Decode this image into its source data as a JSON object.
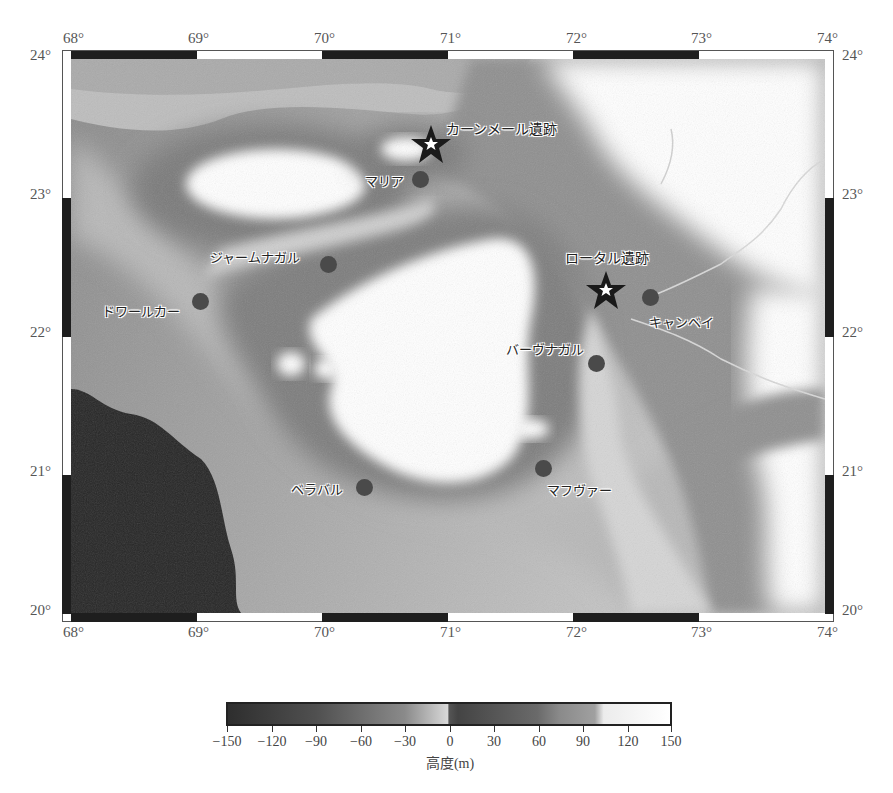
{
  "map": {
    "extent": {
      "lon_min": 68,
      "lon_max": 74,
      "lat_min": 20,
      "lat_max": 24
    },
    "lon_ticks": [
      "68°",
      "69°",
      "70°",
      "71°",
      "72°",
      "73°",
      "74°"
    ],
    "lat_ticks": [
      "24°",
      "23°",
      "22°",
      "21°",
      "20°"
    ],
    "sites": [
      {
        "name": "カーンメール遺跡",
        "type": "star",
        "lon": 70.85,
        "lat": 23.35
      },
      {
        "name": "ロータル遺跡",
        "type": "star",
        "lon": 72.25,
        "lat": 22.3
      }
    ],
    "towns": [
      {
        "name": "マリア",
        "type": "dot",
        "lon": 70.75,
        "lat": 23.12
      },
      {
        "name": "ジャームナガル",
        "type": "dot",
        "lon": 70.05,
        "lat": 22.48
      },
      {
        "name": "ドワールカー",
        "type": "dot",
        "lon": 69.0,
        "lat": 22.24
      },
      {
        "name": "キャンベイ",
        "type": "dot",
        "lon": 72.6,
        "lat": 22.26
      },
      {
        "name": "バーヴナガル",
        "type": "dot",
        "lon": 72.17,
        "lat": 21.8
      },
      {
        "name": "マフヴァー",
        "type": "dot",
        "lon": 71.75,
        "lat": 21.06
      },
      {
        "name": "ベラバル",
        "type": "dot",
        "lon": 70.35,
        "lat": 20.93
      }
    ]
  },
  "colorbar": {
    "title": "高度(m)",
    "ticks": [
      "−150",
      "−120",
      "−90",
      "−60",
      "−30",
      "0",
      "30",
      "60",
      "90",
      "120",
      "150"
    ],
    "min": -150,
    "max": 150,
    "colors": {
      "low": "#2a2a2a",
      "mid": "#e8e8e8",
      "high": "#ffffff"
    }
  },
  "colors": {
    "frame_black": "#1e1e1e",
    "dot": "#4a4a4a",
    "star": "#1a1a1a"
  }
}
